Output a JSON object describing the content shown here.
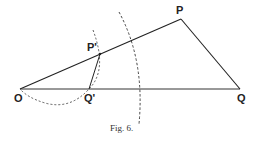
{
  "figure": {
    "caption": "Fig. 6.",
    "points": {
      "O": {
        "label": "O",
        "x": 20,
        "y": 89
      },
      "Qp": {
        "label": "Q'",
        "x": 89,
        "y": 89
      },
      "Pp": {
        "label": "P'",
        "x": 100,
        "y": 54
      },
      "P": {
        "label": "P",
        "x": 181,
        "y": 19
      },
      "Q": {
        "label": "Q",
        "x": 240,
        "y": 89
      }
    },
    "solid_segments": [
      "O-P",
      "O-Q",
      "P-Q",
      "P'-Q'"
    ],
    "dashed_arcs": [
      "large arc through PQ region centered at O",
      "small arc through P' and Q' ending at O"
    ],
    "colors": {
      "ink": "#222222",
      "background": "#ffffff"
    }
  }
}
